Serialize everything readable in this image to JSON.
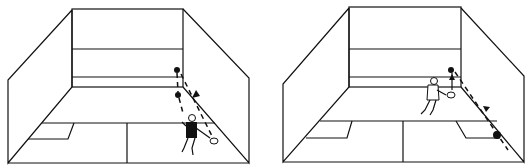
{
  "figure": {
    "panels": [
      {
        "name": "court-left",
        "description": "Player near back right, ball path from front wall down side wall"
      },
      {
        "name": "court-right",
        "description": "Player mid-court, ball rebounds toward back right corner"
      }
    ]
  }
}
